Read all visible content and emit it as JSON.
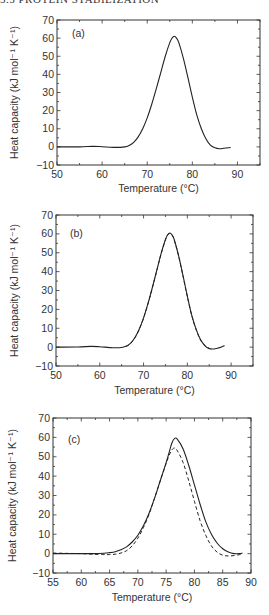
{
  "header": {
    "running_title": "5.5 PROTEIN STABILIZATION"
  },
  "chart_data": [
    {
      "type": "line",
      "panel": "(a)",
      "title": "",
      "xlabel": "Temperature (°C)",
      "ylabel": "Heat capacity (kJ mol⁻¹ K⁻¹)",
      "xlim": [
        50,
        95
      ],
      "ylim": [
        -10,
        70
      ],
      "xticks": [
        50,
        60,
        70,
        80,
        90
      ],
      "yticks": [
        -10,
        0,
        10,
        20,
        30,
        40,
        50,
        60,
        70
      ],
      "grid": false,
      "legend": null,
      "series": [
        {
          "name": "experimental",
          "style": "solid",
          "x": [
            50,
            55,
            58,
            60,
            63,
            65,
            66,
            67,
            68,
            69,
            70,
            71,
            72,
            73,
            74,
            75,
            75.5,
            76,
            76.5,
            77,
            78,
            79,
            80,
            81,
            82,
            83,
            84,
            85,
            86,
            87,
            88,
            88.5
          ],
          "y": [
            0,
            0,
            0.3,
            0.1,
            -0.3,
            0,
            0.8,
            2.5,
            5.5,
            10,
            16,
            23.5,
            32,
            41,
            50,
            57.5,
            60,
            61,
            60,
            57.5,
            49,
            38.5,
            27.5,
            17.5,
            10,
            4.5,
            1,
            -0.5,
            -1,
            -0.8,
            -0.5,
            -0.3
          ]
        }
      ]
    },
    {
      "type": "line",
      "panel": "(b)",
      "title": "",
      "xlabel": "Temperature (°C)",
      "ylabel": "Heat capacity (kJ mol⁻¹ K⁻¹)",
      "xlim": [
        50,
        95
      ],
      "ylim": [
        -10,
        70
      ],
      "xticks": [
        50,
        60,
        70,
        80,
        90
      ],
      "yticks": [
        -10,
        0,
        10,
        20,
        30,
        40,
        50,
        60,
        70
      ],
      "grid": false,
      "legend": null,
      "series": [
        {
          "name": "experimental",
          "style": "solid",
          "x": [
            50,
            55,
            58,
            60,
            63,
            65,
            66,
            67,
            68,
            69,
            70,
            71,
            72,
            73,
            74,
            75,
            75.5,
            76,
            76.5,
            77,
            78,
            79,
            80,
            81,
            82,
            83,
            84,
            85,
            86,
            87,
            88,
            88.5
          ],
          "y": [
            0,
            0.1,
            0.4,
            0.2,
            -0.3,
            -0.2,
            0.5,
            2,
            5,
            9.5,
            15.5,
            23,
            31.5,
            40.5,
            49.5,
            57,
            59.5,
            60.5,
            59.5,
            57,
            48.5,
            38,
            27,
            17,
            9.5,
            4,
            0.8,
            -0.8,
            -1,
            -0.5,
            0.3,
            0.8
          ]
        },
        {
          "name": "fit",
          "style": "dashed",
          "x": [
            66,
            67,
            68,
            69,
            70,
            71,
            72,
            73,
            74,
            75,
            75.5,
            76,
            76.5,
            77,
            78,
            79,
            80,
            81,
            82,
            83,
            84,
            85
          ],
          "y": [
            0.3,
            1.8,
            4.8,
            9.3,
            15.3,
            22.8,
            31.3,
            40.3,
            49.3,
            56.8,
            59.3,
            60.2,
            59.3,
            56.8,
            48.3,
            37.8,
            26.8,
            16.8,
            9.3,
            3.8,
            0.8,
            -0.6
          ]
        }
      ]
    },
    {
      "type": "line",
      "panel": "(c)",
      "title": "",
      "xlabel": "Temperature (°C)",
      "ylabel": "Heat capacity (kJ mol⁻¹ K⁻¹)",
      "xlim": [
        55,
        90
      ],
      "ylim": [
        -10,
        70
      ],
      "xticks": [
        55,
        60,
        65,
        70,
        75,
        80,
        85,
        90
      ],
      "yticks": [
        -10,
        0,
        10,
        20,
        30,
        40,
        50,
        60,
        70
      ],
      "grid": false,
      "legend": null,
      "series": [
        {
          "name": "solid",
          "style": "solid",
          "x": [
            55,
            58,
            60,
            62,
            64,
            65,
            66,
            67,
            68,
            69,
            70,
            71,
            72,
            73,
            74,
            75,
            75.5,
            76,
            76.5,
            77,
            78,
            79,
            80,
            81,
            82,
            83,
            84,
            85,
            86,
            87,
            88,
            88.5
          ],
          "y": [
            0,
            0,
            0,
            0,
            0.2,
            0.5,
            1,
            2,
            3.5,
            6,
            9.5,
            14.5,
            21,
            29,
            38,
            47,
            52,
            57,
            59.5,
            59,
            54,
            45.5,
            35.5,
            25.5,
            16.5,
            10,
            5.5,
            2.5,
            0.8,
            0,
            0,
            0.3
          ]
        },
        {
          "name": "dashed",
          "style": "dashed",
          "x": [
            55,
            58,
            60,
            62,
            64,
            65,
            66,
            67,
            68,
            69,
            70,
            71,
            72,
            73,
            74,
            75,
            75.5,
            76,
            76.5,
            77,
            78,
            79,
            80,
            81,
            82,
            83,
            84,
            85,
            86,
            87,
            88,
            88.5
          ],
          "y": [
            0.3,
            0.1,
            0,
            -0.3,
            -0.5,
            -0.5,
            -0.3,
            0.3,
            1.5,
            4,
            8,
            13.5,
            20.5,
            29,
            38,
            46.5,
            50.5,
            53.5,
            54.5,
            53,
            47,
            37.5,
            27,
            17,
            9.5,
            4,
            0.8,
            -0.8,
            -1.2,
            -1,
            -0.5,
            0
          ]
        }
      ]
    }
  ]
}
